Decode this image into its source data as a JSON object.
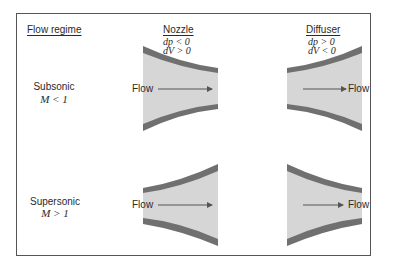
{
  "headers": {
    "flow_regime": "Flow regime",
    "nozzle": "Nozzle",
    "diffuser": "Diffuser"
  },
  "nozzle_conditions": {
    "line1": "dp < 0",
    "line2": "dV > 0"
  },
  "diffuser_conditions": {
    "line1": "dp > 0",
    "line2": "dV < 0"
  },
  "rows": [
    {
      "regime": "Subsonic",
      "mach": "M < 1"
    },
    {
      "regime": "Supersonic",
      "mach": "M > 1"
    }
  ],
  "flow_label": "Flow",
  "colors": {
    "fill": "#d6d6d6",
    "wall": "#707070",
    "frame": "#555555",
    "text": "#2a2a2a"
  }
}
